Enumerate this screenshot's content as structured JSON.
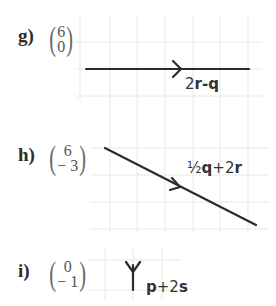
{
  "items": [
    {
      "label": "g)",
      "vector": {
        "top": "6",
        "bottom": "0"
      },
      "annotation": {
        "coef1": "2",
        "v1": "r",
        "op": "-",
        "coef2": "",
        "v2": "q"
      },
      "line": {
        "x1": 86,
        "y1": 69,
        "x2": 249,
        "y2": 69
      },
      "arrow_at": {
        "x": 180,
        "y": 69,
        "dir": "right"
      }
    },
    {
      "label": "h)",
      "vector": {
        "top": "6",
        "bottom": "− 3"
      },
      "annotation": {
        "coef1": "½",
        "v1": "q",
        "op": "+",
        "coef2": "2",
        "v2": "r"
      },
      "line": {
        "x1": 105,
        "y1": 148,
        "x2": 256,
        "y2": 225
      },
      "arrow_at": {
        "x": 180,
        "y": 187,
        "dir": "down-right"
      }
    },
    {
      "label": "i)",
      "vector": {
        "top": "0",
        "bottom": "− 1"
      },
      "annotation": {
        "coef1": "",
        "v1": "p",
        "op": "+",
        "coef2": "2",
        "v2": "s"
      },
      "line": {
        "x1": 133,
        "y1": 265,
        "x2": 133,
        "y2": 290
      },
      "arrow_at": {
        "x": 133,
        "y": 272,
        "dir": "down"
      }
    }
  ],
  "colors": {
    "line": "#2b2b2b",
    "grid": "#e6e6e6",
    "text": "#2d2d2d"
  }
}
